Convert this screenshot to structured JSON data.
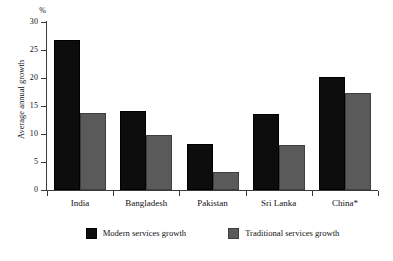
{
  "chart_data": {
    "type": "bar",
    "title": "",
    "subtitle": "",
    "xlabel": "",
    "ylabel": "Average annual growth",
    "unit_label": "%",
    "ylim": [
      0,
      30
    ],
    "yticks": [
      0,
      5,
      10,
      15,
      20,
      25,
      30
    ],
    "ytick_labels": [
      "0",
      "5",
      "10",
      "15",
      "20",
      "25",
      "30"
    ],
    "grid": false,
    "legend_position": "bottom",
    "categories": [
      "India",
      "Bangladesh",
      "Pakistan",
      "Sri Lanka",
      "China*"
    ],
    "series": [
      {
        "name": "Modern services growth",
        "color": "#0d0d0d",
        "values": [
          26.8,
          14.1,
          8.3,
          13.5,
          20.1
        ]
      },
      {
        "name": "Traditional services growth",
        "color": "#5a5a5a",
        "values": [
          13.8,
          9.9,
          3.3,
          8.1,
          17.3
        ]
      }
    ]
  },
  "legend": {
    "items": [
      {
        "label": "Modern services growth"
      },
      {
        "label": "Traditional services growth"
      }
    ]
  }
}
